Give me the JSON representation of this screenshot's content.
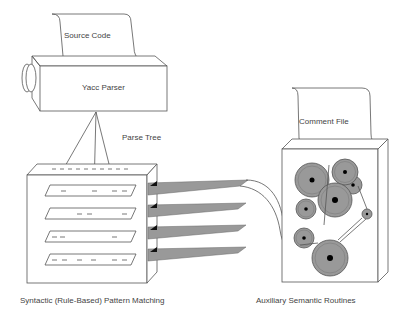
{
  "diagram": {
    "labels": {
      "source_code": "Source Code",
      "yacc_parser": "Yacc Parser",
      "parse_tree": "Parse Tree",
      "comment_file": "Comment File",
      "pattern_matching": "Syntactic (Rule-Based) Pattern Matching",
      "semantic_routines": "Auxiliary Semantic Routines"
    },
    "colors": {
      "line": "#555555",
      "fill_gray": "#9a9a9a",
      "dark": "#111111",
      "background": "#ffffff"
    },
    "pattern_rows": 4,
    "ribbon_count": 4,
    "gear_count": 8
  }
}
